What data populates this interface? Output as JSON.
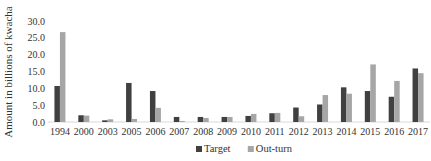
{
  "chart_data": {
    "type": "bar",
    "title": "",
    "xlabel": "",
    "ylabel": "Amount in billions of kwacha",
    "ylim": [
      0,
      30
    ],
    "yticks": [
      "0.0",
      "5.0",
      "10.0",
      "15.0",
      "20.0",
      "25.0",
      "30.0"
    ],
    "grid": false,
    "legend_position": "bottom",
    "categories": [
      "1994",
      "2000",
      "2003",
      "2005",
      "2006",
      "2007",
      "2008",
      "2009",
      "2010",
      "2011",
      "2012",
      "2013",
      "2014",
      "2015",
      "2016",
      "2017"
    ],
    "series": [
      {
        "name": "Target",
        "color": "#404040",
        "values": [
          10.7,
          2.0,
          0.5,
          11.6,
          9.2,
          1.5,
          1.5,
          1.5,
          1.8,
          2.6,
          4.3,
          5.2,
          10.3,
          9.2,
          7.5,
          15.9
        ]
      },
      {
        "name": "Out-turn",
        "color": "#a6a6a6",
        "values": [
          26.7,
          1.9,
          0.8,
          0.9,
          4.2,
          0.3,
          1.2,
          1.5,
          2.4,
          2.7,
          1.7,
          8.0,
          8.4,
          17.1,
          12.2,
          14.5
        ]
      }
    ]
  }
}
